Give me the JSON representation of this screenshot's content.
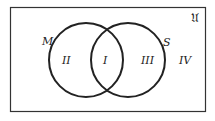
{
  "diagram": {
    "type": "venn",
    "universe_label": "𝔘",
    "sets": [
      {
        "name": "M",
        "cx": 86,
        "cy": 60,
        "r": 37
      },
      {
        "name": "S",
        "cx": 128,
        "cy": 60,
        "r": 37
      }
    ],
    "regions": [
      {
        "id": "II",
        "label": "II",
        "description": "M only"
      },
      {
        "id": "I",
        "label": "I",
        "description": "M and S"
      },
      {
        "id": "III",
        "label": "III",
        "description": "S only"
      },
      {
        "id": "IV",
        "label": "IV",
        "description": "neither"
      }
    ],
    "colors": {
      "stroke": "#222222",
      "background": "#ffffff"
    }
  }
}
